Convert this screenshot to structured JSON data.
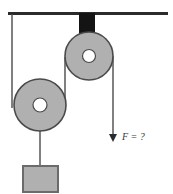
{
  "diagram": {
    "ceiling": {
      "name": "ceiling-support-line",
      "x1": 8,
      "y1": 13.5,
      "x2": 168,
      "y2": 13.5,
      "color": "#2b2b2b",
      "thickness": 3
    },
    "bracket": {
      "name": "fixed-pulley-bracket",
      "x": 79,
      "y": 13,
      "width": 16,
      "height": 44,
      "color": "#141414"
    },
    "fixed_pulley": {
      "name": "fixed-pulley",
      "cx": 89,
      "cy": 56,
      "r": 24,
      "hub_r": 6.5,
      "face_color": "#b0b0b0",
      "edge_color": "#4a4a4a",
      "hub_color": "#ffffff"
    },
    "movable_pulley": {
      "name": "movable-pulley",
      "cx": 40,
      "cy": 105,
      "r": 26,
      "hub_r": 7,
      "face_color": "#b0b0b0",
      "edge_color": "#4a4a4a",
      "hub_color": "#ffffff"
    },
    "ropes": [
      {
        "name": "rope-ceiling-to-movable-pulley",
        "x1": 12,
        "y1": 14,
        "x2": 12,
        "y2": 108,
        "color": "#4a4a4a",
        "thickness": 1.4
      },
      {
        "name": "rope-fixed-pulley-to-movable-pulley",
        "x1": 65,
        "y1": 57,
        "x2": 65,
        "y2": 108,
        "color": "#4a4a4a",
        "thickness": 1.4
      },
      {
        "name": "rope-movable-pulley-to-block",
        "x1": 40,
        "y1": 105,
        "x2": 40,
        "y2": 166,
        "color": "#4a4a4a",
        "thickness": 1.4
      },
      {
        "name": "rope-applied-force",
        "x1": 113,
        "y1": 56,
        "x2": 113,
        "y2": 135,
        "color": "#4a4a4a",
        "thickness": 1.4
      }
    ],
    "force_arrow": {
      "name": "force-arrow-down",
      "tip_x": 113,
      "tip_y": 142,
      "half_width": 4,
      "head_length": 8,
      "color": "#2b2b2b"
    },
    "force_label": {
      "name": "force-label",
      "text": "F = ?",
      "x": 122,
      "y": 140,
      "color": "#3a3a3a"
    },
    "block": {
      "name": "hanging-block",
      "x": 23,
      "y": 166,
      "width": 35,
      "height": 26,
      "face_color": "#b0b0b0",
      "edge_color": "#6b6b6b",
      "edge_width": 2
    }
  }
}
